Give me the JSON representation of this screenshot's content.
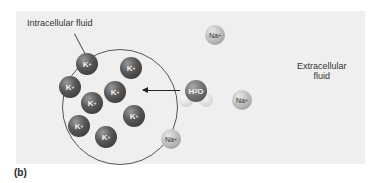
{
  "figure": {
    "caption": "(b)",
    "labels": {
      "intracellular": "Intracellular fluid",
      "extracellular_line1": "Extracellular",
      "extracellular_line2": "fluid"
    },
    "ions": {
      "potassium": {
        "symbol": "K",
        "charge": "+",
        "count": 8
      },
      "sodium": {
        "symbol": "Na",
        "charge": "+",
        "count": 3
      }
    },
    "water": {
      "symbol": "H",
      "subscript": "2",
      "symbol2": "O"
    },
    "arrow": {
      "direction": "into-cell",
      "meaning": "water moves into cell"
    },
    "colors": {
      "background": "#efefef",
      "potassium": "#4a4a4a",
      "sodium": "#b8b8b8",
      "membrane": "#555555"
    }
  }
}
